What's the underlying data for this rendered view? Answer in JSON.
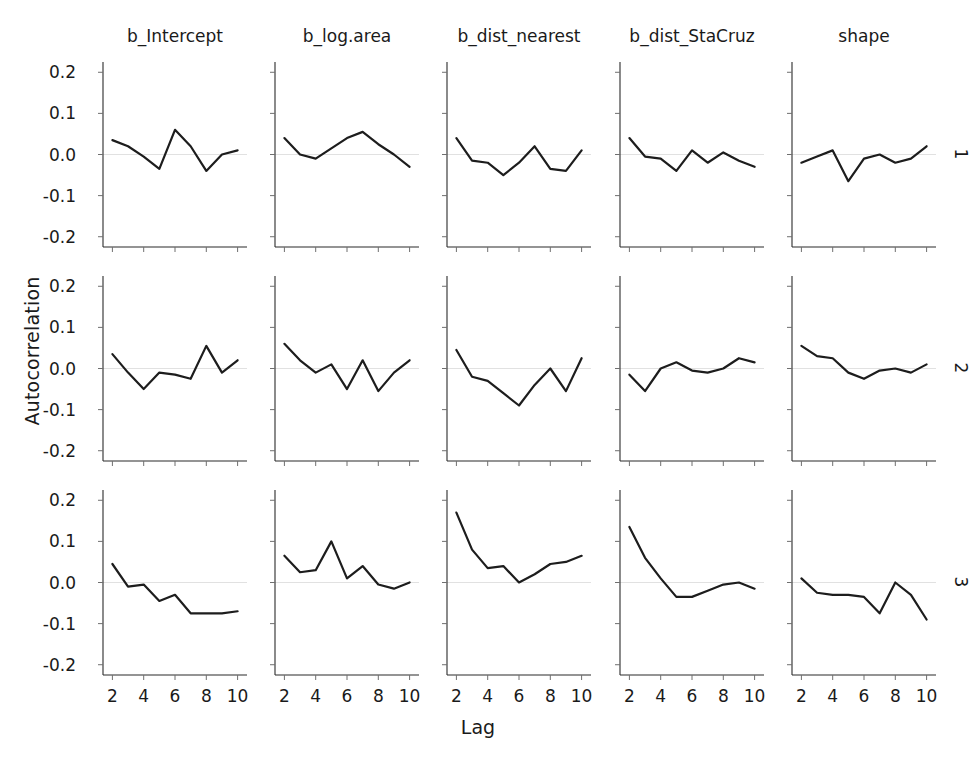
{
  "chart_data": {
    "type": "line",
    "title": "",
    "xlabel": "Lag",
    "ylabel": "Autocorrelation",
    "xlim": [
      1.4,
      10.6
    ],
    "ylim": [
      -0.225,
      0.225
    ],
    "xticks": [
      2,
      4,
      6,
      8,
      10
    ],
    "xtick_labels": [
      "2",
      "4",
      "6",
      "8",
      "10"
    ],
    "yticks": [
      -0.2,
      -0.1,
      0.0,
      0.1,
      0.2
    ],
    "ytick_labels": [
      "-0.2",
      "-0.1",
      "0.0",
      "0.1",
      "0.2"
    ],
    "grid": false,
    "legend": "none",
    "facet_columns": [
      "b_Intercept",
      "b_log.area",
      "b_dist_nearest",
      "b_dist_StaCruz",
      "shape"
    ],
    "facet_rows": [
      "1",
      "2",
      "3"
    ],
    "x": [
      2,
      3,
      4,
      5,
      6,
      7,
      8,
      9,
      10
    ],
    "panels": [
      {
        "row": "1",
        "column": "b_Intercept",
        "values": [
          0.035,
          0.02,
          -0.005,
          -0.035,
          0.06,
          0.02,
          -0.04,
          0.0,
          0.01
        ]
      },
      {
        "row": "1",
        "column": "b_log.area",
        "values": [
          0.04,
          0.0,
          -0.01,
          0.015,
          0.04,
          0.055,
          0.025,
          0.0,
          -0.03
        ]
      },
      {
        "row": "1",
        "column": "b_dist_nearest",
        "values": [
          0.04,
          -0.015,
          -0.02,
          -0.05,
          -0.02,
          0.02,
          -0.035,
          -0.04,
          0.01
        ]
      },
      {
        "row": "1",
        "column": "b_dist_StaCruz",
        "values": [
          0.04,
          -0.005,
          -0.01,
          -0.04,
          0.01,
          -0.02,
          0.005,
          -0.015,
          -0.03
        ]
      },
      {
        "row": "1",
        "column": "shape",
        "values": [
          -0.02,
          -0.005,
          0.01,
          -0.065,
          -0.01,
          0.0,
          -0.02,
          -0.01,
          0.02
        ]
      },
      {
        "row": "2",
        "column": "b_Intercept",
        "values": [
          0.035,
          -0.01,
          -0.05,
          -0.01,
          -0.015,
          -0.025,
          0.055,
          -0.01,
          0.02
        ]
      },
      {
        "row": "2",
        "column": "b_log.area",
        "values": [
          0.06,
          0.02,
          -0.01,
          0.01,
          -0.05,
          0.02,
          -0.055,
          -0.01,
          0.02
        ]
      },
      {
        "row": "2",
        "column": "b_dist_nearest",
        "values": [
          0.045,
          -0.02,
          -0.03,
          -0.06,
          -0.09,
          -0.04,
          0.0,
          -0.055,
          0.025
        ]
      },
      {
        "row": "2",
        "column": "b_dist_StaCruz",
        "values": [
          -0.015,
          -0.055,
          0.0,
          0.015,
          -0.005,
          -0.01,
          0.0,
          0.025,
          0.015
        ]
      },
      {
        "row": "2",
        "column": "shape",
        "values": [
          0.055,
          0.03,
          0.025,
          -0.01,
          -0.025,
          -0.005,
          0.0,
          -0.01,
          0.01
        ]
      },
      {
        "row": "3",
        "column": "b_Intercept",
        "values": [
          0.045,
          -0.01,
          -0.005,
          -0.045,
          -0.03,
          -0.075,
          -0.075,
          -0.075,
          -0.07
        ]
      },
      {
        "row": "3",
        "column": "b_log.area",
        "values": [
          0.065,
          0.025,
          0.03,
          0.1,
          0.01,
          0.04,
          -0.005,
          -0.015,
          0.0
        ]
      },
      {
        "row": "3",
        "column": "b_dist_nearest",
        "values": [
          0.17,
          0.08,
          0.035,
          0.04,
          0.0,
          0.02,
          0.045,
          0.05,
          0.065
        ]
      },
      {
        "row": "3",
        "column": "b_dist_StaCruz",
        "values": [
          0.135,
          0.06,
          0.01,
          -0.035,
          -0.035,
          -0.02,
          -0.005,
          0.0,
          -0.015
        ]
      },
      {
        "row": "3",
        "column": "shape",
        "values": [
          0.01,
          -0.025,
          -0.03,
          -0.03,
          -0.035,
          -0.075,
          0.0,
          -0.03,
          -0.09
        ]
      }
    ]
  },
  "axes": {
    "x_title": "Lag",
    "y_title": "Autocorrelation"
  },
  "colors": {
    "series": "#1d1d1d",
    "axis": "#2b2b2b",
    "tick": "#6f6f6f",
    "background": "#ffffff"
  }
}
